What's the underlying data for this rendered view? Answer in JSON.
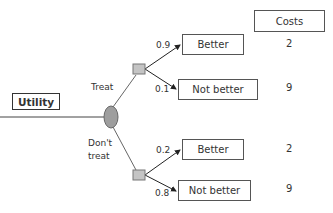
{
  "title_box": {
    "label": "Utility"
  },
  "costs_header": {
    "label": "Costs"
  },
  "decision_node": {
    "type": "chance-ellipse"
  },
  "branches": [
    {
      "label": "Treat",
      "outcomes": [
        {
          "probability": "0.9",
          "label": "Better",
          "cost": "2"
        },
        {
          "probability": "0.1",
          "label": "Not better",
          "cost": "9"
        }
      ]
    },
    {
      "label_line1": "Don't",
      "label_line2": "treat",
      "outcomes": [
        {
          "probability": "0.2",
          "label": "Better",
          "cost": "2"
        },
        {
          "probability": "0.8",
          "label": "Not better",
          "cost": "9"
        }
      ]
    }
  ],
  "colors": {
    "node_fill": "#b3b3b3",
    "ellipse_fill": "#9e9e9e",
    "line": "#444444"
  }
}
